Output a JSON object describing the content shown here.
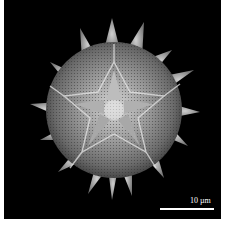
{
  "image": {
    "subject": "SEM micrograph of echinate pollen grain",
    "background_color": "#000000",
    "border_color": "#ffffff"
  },
  "scale_bar": {
    "label": "10 µm",
    "color": "#ffffff"
  }
}
